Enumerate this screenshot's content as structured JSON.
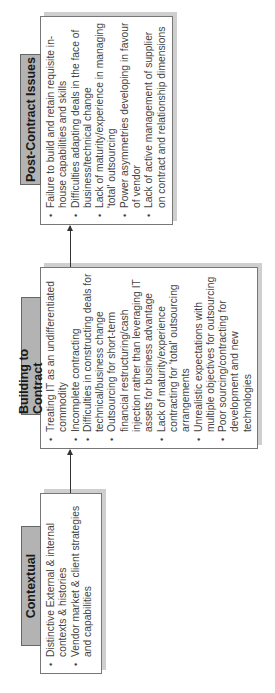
{
  "stages": [
    {
      "title": "Contextual",
      "items": [
        "Distinctive External & internal contexts & histories",
        "Vendor market & client strategies and capabilities"
      ]
    },
    {
      "title": "Building to Contract",
      "items": [
        "Treating IT as an undifferentiated commodity",
        "Incomplete contracting",
        "Difficulties in constructing deals for technical/business change",
        "Outsourcing for short-term financial restructuring/cash injection rather than leveraging IT assets for business advantage",
        "Lack of maturity/experience contracting for 'total' outsourcing arrangements",
        "Unrealistic expectations with multiple objectives for outsourcing",
        "Poor sourcing/contracting for development and new technologies"
      ]
    },
    {
      "title": "Post-Contract Issues",
      "items": [
        "Failure to build and retain requisite in-house capabilities and skills",
        "Difficulties adapting deals in the face of business/technical change",
        "Lack of maturity/experience in managing 'total' outsourcing",
        "Power asymmetries developing in favour of vendor",
        "Lack of active management of supplier on contract and relationship dimensions"
      ]
    }
  ],
  "colors": {
    "tab_fill": "#b3b3b3",
    "shadow": "#cfcfcf",
    "border": "#777777"
  }
}
